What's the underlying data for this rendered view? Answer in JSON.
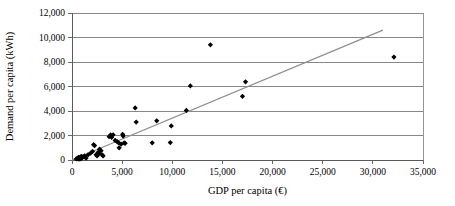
{
  "chart_data": {
    "type": "scatter",
    "title": "",
    "xlabel": "GDP per capita (€)",
    "ylabel": "Demand per capita (kWh)",
    "xlim": [
      0,
      35000
    ],
    "ylim": [
      0,
      12000
    ],
    "xticks": [
      0,
      5000,
      10000,
      15000,
      20000,
      25000,
      30000,
      35000
    ],
    "yticks": [
      0,
      2000,
      4000,
      6000,
      8000,
      10000,
      12000
    ],
    "xtick_labels": [
      "0",
      "5,000",
      "10,000",
      "15,000",
      "20,000",
      "25,000",
      "30,000",
      "35,000"
    ],
    "ytick_labels": [
      "0",
      "2,000",
      "4,000",
      "6,000",
      "8,000",
      "10,000",
      "12,000"
    ],
    "grid": "horizontal",
    "legend": "none",
    "marker": "diamond",
    "marker_color": "#000000",
    "points": [
      {
        "x": 420,
        "y": 90
      },
      {
        "x": 520,
        "y": 120
      },
      {
        "x": 600,
        "y": 150
      },
      {
        "x": 650,
        "y": 210
      },
      {
        "x": 700,
        "y": 60
      },
      {
        "x": 760,
        "y": 130
      },
      {
        "x": 820,
        "y": 240
      },
      {
        "x": 880,
        "y": 100
      },
      {
        "x": 930,
        "y": 300
      },
      {
        "x": 1000,
        "y": 180
      },
      {
        "x": 1100,
        "y": 260
      },
      {
        "x": 1250,
        "y": 330
      },
      {
        "x": 1400,
        "y": 150
      },
      {
        "x": 1600,
        "y": 420
      },
      {
        "x": 1850,
        "y": 560
      },
      {
        "x": 2050,
        "y": 700
      },
      {
        "x": 2150,
        "y": 1250
      },
      {
        "x": 2250,
        "y": 1180
      },
      {
        "x": 2400,
        "y": 430
      },
      {
        "x": 2500,
        "y": 330
      },
      {
        "x": 2600,
        "y": 620
      },
      {
        "x": 2700,
        "y": 520
      },
      {
        "x": 2750,
        "y": 880
      },
      {
        "x": 2900,
        "y": 760
      },
      {
        "x": 3000,
        "y": 420
      },
      {
        "x": 3100,
        "y": 330
      },
      {
        "x": 3700,
        "y": 1900
      },
      {
        "x": 3850,
        "y": 2050
      },
      {
        "x": 3950,
        "y": 1850
      },
      {
        "x": 4100,
        "y": 2060
      },
      {
        "x": 4300,
        "y": 1600
      },
      {
        "x": 4500,
        "y": 1500
      },
      {
        "x": 4650,
        "y": 1400
      },
      {
        "x": 4700,
        "y": 990
      },
      {
        "x": 4900,
        "y": 1290
      },
      {
        "x": 5050,
        "y": 2100
      },
      {
        "x": 5100,
        "y": 1950
      },
      {
        "x": 5200,
        "y": 1390
      },
      {
        "x": 5300,
        "y": 1360
      },
      {
        "x": 6300,
        "y": 4250
      },
      {
        "x": 6400,
        "y": 3100
      },
      {
        "x": 8000,
        "y": 1400
      },
      {
        "x": 8450,
        "y": 3200
      },
      {
        "x": 9800,
        "y": 1420
      },
      {
        "x": 9900,
        "y": 2780
      },
      {
        "x": 11400,
        "y": 4050
      },
      {
        "x": 11800,
        "y": 6050
      },
      {
        "x": 13800,
        "y": 9400
      },
      {
        "x": 17000,
        "y": 5200
      },
      {
        "x": 17300,
        "y": 6380
      },
      {
        "x": 32100,
        "y": 8400
      }
    ],
    "trendline": {
      "label": "linear trend",
      "color": "#8f8f8f",
      "x_start": 0,
      "y_start": 0,
      "x_end": 31000,
      "y_end": 10600
    }
  }
}
